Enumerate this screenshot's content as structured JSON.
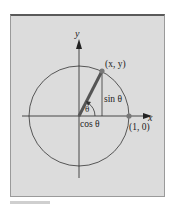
{
  "figure": {
    "labels": {
      "y_axis": "y",
      "x_axis": "x",
      "point_xy": "(x, y)",
      "sin": "sin θ",
      "cos": "cos θ",
      "theta": "θ",
      "point_10": "(1, 0)"
    },
    "colors": {
      "panel": "#dcdcdc",
      "line": "#333333",
      "radius": "#555555",
      "point": "#777777"
    }
  }
}
